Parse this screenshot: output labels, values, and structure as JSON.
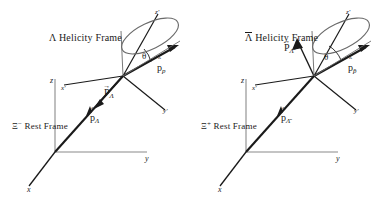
{
  "figure": {
    "caption_absent": true,
    "background_color": "#ffffff",
    "line_color": "#1a1a1a",
    "cone_color": "#555555",
    "axis_color": "#808080"
  },
  "panels": [
    {
      "id": "left",
      "frame_title": "Λ Helicity Frame",
      "rest_frame_label": "Ξ⁻ Rest Frame",
      "rest_frame_symbol": "Ξ",
      "rest_frame_charge": "−",
      "rest_frame_suffix": " Rest Frame",
      "axes": [
        {
          "name": "z-axis-label",
          "label": "z"
        },
        {
          "name": "y-axis-label",
          "label": "y"
        },
        {
          "name": "x-axis-label",
          "label": "x"
        }
      ],
      "primed_axes": [
        {
          "name": "z-prime-axis-label",
          "label": "z'"
        },
        {
          "name": "x-prime-axis-label",
          "label": "x'"
        },
        {
          "name": "y-prime-axis-label",
          "label": "y'"
        }
      ],
      "angle_label": "θ",
      "vectors": [
        {
          "name": "proton-momentum",
          "base": "p",
          "accent": "hat",
          "subscript": "p"
        },
        {
          "name": "lambda-polarization",
          "base": "P",
          "accent": "arrow",
          "subscript": "Λ"
        },
        {
          "name": "lambda-momentum",
          "base": "p",
          "accent": "hat",
          "subscript": "Λ"
        }
      ]
    },
    {
      "id": "right",
      "frame_title": "Λ̄ Helicity Frame",
      "frame_title_symbol": "Λ",
      "frame_title_suffix": " Helicity Frame",
      "rest_frame_label": "Ξ⁺ Rest Frame",
      "rest_frame_symbol": "Ξ",
      "rest_frame_charge": "+",
      "rest_frame_suffix": " Rest Frame",
      "axes": [
        {
          "name": "z-axis-label",
          "label": "z"
        },
        {
          "name": "y-axis-label",
          "label": "y"
        },
        {
          "name": "x-axis-label",
          "label": "x"
        }
      ],
      "primed_axes": [
        {
          "name": "z-prime-axis-label",
          "label": "z'"
        },
        {
          "name": "x-prime-axis-label",
          "label": "x'"
        },
        {
          "name": "y-prime-axis-label",
          "label": "y'"
        }
      ],
      "angle_label": "θ",
      "vectors": [
        {
          "name": "antiproton-momentum",
          "base": "p",
          "accent": "hat",
          "subscript": "p̄"
        },
        {
          "name": "antilambda-polarization",
          "base": "P",
          "accent": "arrow",
          "subscript": "Λ̄"
        },
        {
          "name": "antilambda-momentum",
          "base": "p",
          "accent": "hat",
          "subscript": "Λ̄"
        }
      ]
    }
  ],
  "glyphs": {
    "lambda": "Λ",
    "xi": "Ξ",
    "theta": "θ",
    "p_lower": "p",
    "P_upper": "P",
    "hat": "ˆ",
    "arrow": "→",
    "z": "z",
    "y": "y",
    "x": "x",
    "z_prime": "z'",
    "x_prime": "x'",
    "y_prime": "y'",
    "minus": "−",
    "plus": "+"
  }
}
